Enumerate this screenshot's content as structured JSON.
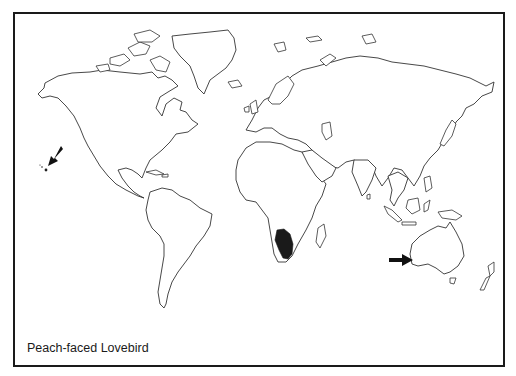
{
  "map": {
    "title": "Peach-faced Lovebird",
    "type": "world distribution map",
    "range_color": "#1a1a1a",
    "outline_color": "#333333",
    "native_range": {
      "label": "Native range",
      "region": "Southwestern Africa"
    },
    "markers": [
      {
        "name": "hawaii-arrow",
        "region": "Hawaii",
        "direction": "down-left"
      },
      {
        "name": "australia-arrow",
        "region": "Western Australia",
        "direction": "right"
      }
    ]
  }
}
